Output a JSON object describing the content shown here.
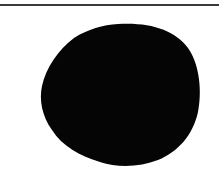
{
  "image": {
    "description": "Black irregular rounded blob on white background beneath a thin horizontal rule",
    "colors": {
      "background": "#ffffff",
      "blob": "#050505",
      "rule": "#3a3a3a"
    },
    "shapes": [
      {
        "type": "horizontal-line",
        "y": 5,
        "x_start": 0,
        "x_end": 219
      },
      {
        "type": "blob",
        "bbox": {
          "x": 40,
          "y": 24,
          "width": 160,
          "height": 142
        }
      }
    ]
  }
}
